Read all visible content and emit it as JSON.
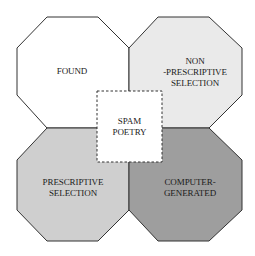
{
  "diagram": {
    "center": {
      "label_line1": "SPAM",
      "label_line2": "POETRY",
      "fill": "#ffffff",
      "border": "dashed"
    },
    "quadrants": [
      {
        "id": "top-left",
        "label_lines": [
          "FOUND"
        ],
        "fill": "#ffffff"
      },
      {
        "id": "top-right",
        "label_lines": [
          "NON",
          "-PRESCRIPTIVE",
          "SELECTION"
        ],
        "fill": "#eaeaea"
      },
      {
        "id": "bottom-left",
        "label_lines": [
          "PRESCRIPTIVE",
          "SELECTION"
        ],
        "fill": "#cfcfcf"
      },
      {
        "id": "bottom-right",
        "label_lines": [
          "COMPUTER-",
          "GENERATED"
        ],
        "fill": "#9e9e9e"
      }
    ]
  }
}
